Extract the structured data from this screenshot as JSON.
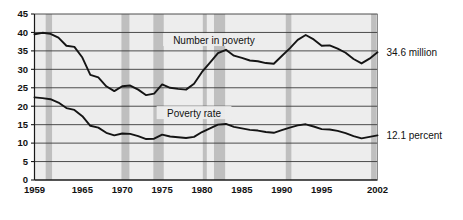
{
  "figure": {
    "title_partial": "",
    "background": "#ffffff",
    "plot_background": "#ededed",
    "grid_color": "#3a3a3a",
    "band_color": "#bfbfbf",
    "line_color": "#141414"
  },
  "chart_data": {
    "type": "line",
    "title": "",
    "xlabel": "",
    "ylabel": "",
    "xlim": [
      1959,
      2002
    ],
    "ylim": [
      0,
      45
    ],
    "ytick_values": [
      0,
      5,
      10,
      15,
      20,
      25,
      30,
      35,
      40,
      45
    ],
    "ytick_labels": [
      "0",
      "5",
      "10",
      "15",
      "20",
      "25",
      "30",
      "35",
      "40",
      "45"
    ],
    "xtick_values": [
      1959,
      1965,
      1970,
      1975,
      1980,
      1985,
      1990,
      1995,
      2002
    ],
    "xtick_labels": [
      "1959",
      "1965",
      "1970",
      "1975",
      "1980",
      "1985",
      "1990",
      "1995",
      "2002"
    ],
    "grid": true,
    "grid_axis": "y",
    "legend": "inline-annotations",
    "x": [
      1959,
      1960,
      1961,
      1962,
      1963,
      1964,
      1965,
      1966,
      1967,
      1968,
      1969,
      1970,
      1971,
      1972,
      1973,
      1974,
      1975,
      1976,
      1977,
      1978,
      1979,
      1980,
      1981,
      1982,
      1983,
      1984,
      1985,
      1986,
      1987,
      1988,
      1989,
      1990,
      1991,
      1992,
      1993,
      1994,
      1995,
      1996,
      1997,
      1998,
      1999,
      2000,
      2001,
      2002
    ],
    "series": [
      {
        "name": "Number in poverty",
        "label": "Number in poverty",
        "units": "million",
        "end_value": 34.6,
        "end_label": "34.6 million",
        "values": [
          39.5,
          39.9,
          39.6,
          38.6,
          36.4,
          36.1,
          33.2,
          28.5,
          27.8,
          25.4,
          24.1,
          25.4,
          25.6,
          24.5,
          23.0,
          23.4,
          25.9,
          25.0,
          24.7,
          24.5,
          26.1,
          29.3,
          31.8,
          34.4,
          35.3,
          33.7,
          33.1,
          32.4,
          32.2,
          31.7,
          31.5,
          33.6,
          35.7,
          38.0,
          39.3,
          38.1,
          36.4,
          36.5,
          35.6,
          34.5,
          32.8,
          31.6,
          32.9,
          34.6
        ]
      },
      {
        "name": "Poverty rate",
        "label": "Poverty rate",
        "units": "percent",
        "end_value": 12.1,
        "end_label": "12.1 percent",
        "values": [
          22.4,
          22.2,
          21.9,
          21.0,
          19.5,
          19.0,
          17.3,
          14.7,
          14.2,
          12.8,
          12.1,
          12.6,
          12.5,
          11.9,
          11.1,
          11.2,
          12.3,
          11.8,
          11.6,
          11.4,
          11.7,
          13.0,
          14.0,
          15.0,
          15.2,
          14.4,
          14.0,
          13.6,
          13.4,
          13.0,
          12.8,
          13.5,
          14.2,
          14.8,
          15.1,
          14.5,
          13.8,
          13.7,
          13.3,
          12.7,
          11.9,
          11.3,
          11.7,
          12.1
        ]
      }
    ],
    "recession_bands": [
      {
        "start": 1960.4,
        "end": 1961.2
      },
      {
        "start": 1969.9,
        "end": 1970.9
      },
      {
        "start": 1973.9,
        "end": 1975.2
      },
      {
        "start": 1980.1,
        "end": 1980.6
      },
      {
        "start": 1981.5,
        "end": 1982.9
      },
      {
        "start": 1990.5,
        "end": 1991.2
      },
      {
        "start": 2001.2,
        "end": 2001.9
      }
    ],
    "annotations": [
      {
        "name": "number-in-poverty-label",
        "text": "Number in poverty",
        "x": 1981.5,
        "y": 37.8
      },
      {
        "name": "poverty-rate-label",
        "text": "Poverty rate",
        "y": 18.0,
        "x": 1979.0
      },
      {
        "name": "end-value-number",
        "text": "34.6 million"
      },
      {
        "name": "end-value-rate",
        "text": "12.1 percent"
      }
    ]
  },
  "axes": {
    "y_title": "",
    "x_title": ""
  }
}
